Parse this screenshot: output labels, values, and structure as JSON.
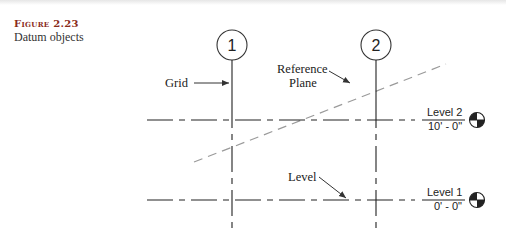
{
  "caption": {
    "label": "Figure 2.23",
    "title": "Datum objects"
  },
  "grids": [
    {
      "label": "1"
    },
    {
      "label": "2"
    }
  ],
  "levels": [
    {
      "name": "Level 2",
      "elevation": "10' - 0\""
    },
    {
      "name": "Level 1",
      "elevation": "0' - 0\""
    }
  ],
  "callouts": {
    "grid": "Grid",
    "reference_plane_line1": "Reference",
    "reference_plane_line2": "Plane",
    "level": "Level"
  },
  "colors": {
    "lines": "#222222",
    "reference_plane": "#9a9a9a",
    "caption_label": "#8a2b1a"
  }
}
